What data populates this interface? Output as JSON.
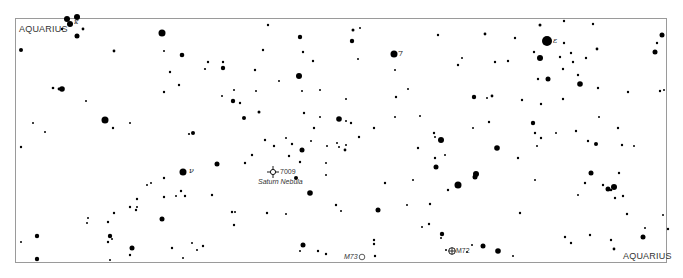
{
  "map": {
    "type": "star-chart",
    "constellation_labels": [
      {
        "text": "AQUARIUS",
        "x": 19,
        "y": 22
      },
      {
        "text": "AQUARIUS",
        "x": 623,
        "y": 250
      }
    ],
    "greek_labels": [
      {
        "text": "ν",
        "x": 190,
        "y": 168,
        "note": "nu"
      },
      {
        "text": "ε",
        "x": 554,
        "y": 38,
        "note": "epsilon"
      },
      {
        "text": "7",
        "x": 398,
        "y": 51
      },
      {
        "text": "κ",
        "x": 74,
        "y": 20
      }
    ],
    "deep_sky_objects": [
      {
        "id": "7009",
        "name": "Saturn Nebula",
        "type": "planetary-nebula",
        "x": 273,
        "y": 172
      },
      {
        "id": "M73",
        "type": "asterism",
        "x": 372,
        "y": 257
      },
      {
        "id": "M72",
        "type": "globular-cluster",
        "x": 452,
        "y": 251
      }
    ],
    "stars": [
      [
        67,
        19,
        3
      ],
      [
        77,
        17,
        3
      ],
      [
        70,
        24,
        3
      ],
      [
        62,
        29,
        1.2
      ],
      [
        83,
        29,
        1.4
      ],
      [
        77,
        36,
        2.5
      ],
      [
        162,
        33,
        3.5
      ],
      [
        21,
        50,
        2
      ],
      [
        114,
        51,
        1.4
      ],
      [
        164,
        51,
        1
      ],
      [
        182,
        55,
        2.3
      ],
      [
        208,
        62,
        1.2
      ],
      [
        205,
        69,
        1.1
      ],
      [
        223,
        62,
        1.2
      ],
      [
        223,
        68,
        2.2
      ],
      [
        170,
        72,
        1.2
      ],
      [
        53,
        88,
        1.3
      ],
      [
        59,
        89,
        1.4
      ],
      [
        62,
        89,
        2.8
      ],
      [
        105,
        120,
        3.5
      ],
      [
        86,
        101,
        1
      ],
      [
        33,
        123,
        1
      ],
      [
        45,
        132,
        1
      ],
      [
        113,
        128,
        1.2
      ],
      [
        130,
        123,
        1
      ],
      [
        189,
        134,
        1.1
      ],
      [
        193,
        133,
        2
      ],
      [
        164,
        92,
        1.2
      ],
      [
        179,
        85,
        1.2
      ],
      [
        234,
        90,
        1
      ],
      [
        222,
        96,
        1
      ],
      [
        233,
        101,
        2.2
      ],
      [
        268,
        25,
        1.2
      ],
      [
        300,
        37,
        2.2
      ],
      [
        263,
        50,
        1.2
      ],
      [
        303,
        52,
        1.2
      ],
      [
        313,
        61,
        1.2
      ],
      [
        299,
        76,
        3
      ],
      [
        255,
        70,
        1.2
      ],
      [
        256,
        91,
        1
      ],
      [
        302,
        91,
        1
      ],
      [
        279,
        81,
        1
      ],
      [
        240,
        103,
        1.2
      ],
      [
        259,
        112,
        1.5
      ],
      [
        244,
        118,
        2
      ],
      [
        320,
        90,
        1
      ],
      [
        320,
        117,
        1
      ],
      [
        353,
        30,
        1.5
      ],
      [
        360,
        28,
        1
      ],
      [
        352,
        41,
        2.2
      ],
      [
        394,
        54,
        3.5
      ],
      [
        395,
        70,
        1
      ],
      [
        438,
        35,
        1.2
      ],
      [
        396,
        97,
        1.2
      ],
      [
        408,
        89,
        1
      ],
      [
        358,
        59,
        1
      ],
      [
        339,
        119,
        2.8
      ],
      [
        351,
        123,
        1.2
      ],
      [
        374,
        128,
        1.2
      ],
      [
        420,
        116,
        1
      ],
      [
        395,
        117,
        1
      ],
      [
        462,
        58,
        1
      ],
      [
        495,
        62,
        1.2
      ],
      [
        485,
        34,
        1.4
      ],
      [
        515,
        38,
        1.2
      ],
      [
        540,
        25,
        1.5
      ],
      [
        564,
        21,
        1.2
      ],
      [
        593,
        24,
        1.2
      ],
      [
        547,
        41,
        5
      ],
      [
        564,
        43,
        1.2
      ],
      [
        534,
        52,
        1.2
      ],
      [
        540,
        58,
        3
      ],
      [
        571,
        53,
        1.2
      ],
      [
        586,
        58,
        1.2
      ],
      [
        560,
        57,
        1.2
      ],
      [
        597,
        49,
        1.4
      ],
      [
        508,
        61,
        1.2
      ],
      [
        573,
        62,
        1.2
      ],
      [
        563,
        69,
        1.2
      ],
      [
        538,
        79,
        1.2
      ],
      [
        548,
        79,
        2.5
      ],
      [
        578,
        75,
        1.2
      ],
      [
        580,
        84,
        2.8
      ],
      [
        458,
        65,
        1.2
      ],
      [
        474,
        97,
        2.2
      ],
      [
        487,
        98,
        1
      ],
      [
        522,
        100,
        1.2
      ],
      [
        541,
        104,
        1.2
      ],
      [
        563,
        99,
        1.2
      ],
      [
        598,
        88,
        1.2
      ],
      [
        628,
        92,
        1.2
      ],
      [
        662,
        35,
        2.5
      ],
      [
        657,
        43,
        1.2
      ],
      [
        655,
        52,
        2.5
      ],
      [
        660,
        91,
        1.2
      ],
      [
        664,
        90,
        1
      ],
      [
        434,
        133,
        1.2
      ],
      [
        441,
        140,
        3
      ],
      [
        435,
        137,
        1
      ],
      [
        473,
        128,
        1
      ],
      [
        489,
        122,
        1.2
      ],
      [
        533,
        123,
        2.2
      ],
      [
        492,
        96,
        1.4
      ],
      [
        418,
        148,
        1.2
      ],
      [
        435,
        158,
        1.2
      ],
      [
        413,
        180,
        1
      ],
      [
        436,
        167,
        2.5
      ],
      [
        445,
        155,
        1
      ],
      [
        475,
        177,
        2.5
      ],
      [
        458,
        185,
        3.5
      ],
      [
        448,
        190,
        1.2
      ],
      [
        407,
        205,
        1
      ],
      [
        385,
        183,
        1.2
      ],
      [
        378,
        210,
        2.5
      ],
      [
        422,
        227,
        1
      ],
      [
        442,
        234,
        2.2
      ],
      [
        430,
        204,
        1.2
      ],
      [
        429,
        224,
        1.2
      ],
      [
        497,
        148,
        2.8
      ],
      [
        476,
        174,
        3
      ],
      [
        518,
        158,
        1.2
      ],
      [
        535,
        133,
        1.2
      ],
      [
        535,
        180,
        1
      ],
      [
        541,
        138,
        1.2
      ],
      [
        537,
        146,
        1
      ],
      [
        556,
        133,
        1
      ],
      [
        576,
        131,
        1.2
      ],
      [
        588,
        141,
        1.2
      ],
      [
        596,
        144,
        2
      ],
      [
        622,
        145,
        1.2
      ],
      [
        634,
        146,
        1
      ],
      [
        618,
        128,
        1.2
      ],
      [
        608,
        189,
        2.5
      ],
      [
        603,
        185,
        1.2
      ],
      [
        611,
        190,
        1.3
      ],
      [
        614,
        187,
        3
      ],
      [
        615,
        198,
        1.2
      ],
      [
        623,
        196,
        1.2
      ],
      [
        627,
        214,
        1.2
      ],
      [
        645,
        228,
        1
      ],
      [
        643,
        237,
        2.5
      ],
      [
        565,
        237,
        1.2
      ],
      [
        571,
        243,
        1.2
      ],
      [
        590,
        235,
        1.2
      ],
      [
        614,
        249,
        1.4
      ],
      [
        668,
        229,
        1.2
      ],
      [
        663,
        215,
        1
      ],
      [
        483,
        246,
        2.5
      ],
      [
        498,
        251,
        2.8
      ],
      [
        513,
        256,
        1
      ],
      [
        446,
        250,
        1
      ],
      [
        472,
        245,
        1
      ],
      [
        520,
        213,
        1.2
      ],
      [
        611,
        240,
        1.2
      ],
      [
        599,
        117,
        1
      ],
      [
        619,
        173,
        1.2
      ],
      [
        585,
        183,
        1.2
      ],
      [
        591,
        173,
        2.5
      ],
      [
        578,
        195,
        1
      ],
      [
        21,
        147,
        1.2
      ],
      [
        37,
        236,
        2.2
      ],
      [
        37,
        259,
        2.2
      ],
      [
        21,
        242,
        1
      ],
      [
        110,
        236,
        2.2
      ],
      [
        112,
        239,
        1
      ],
      [
        130,
        255,
        1.2
      ],
      [
        110,
        260,
        1
      ],
      [
        132,
        248,
        2.5
      ],
      [
        183,
        172,
        3.5
      ],
      [
        217,
        164,
        2.5
      ],
      [
        212,
        195,
        1.2
      ],
      [
        203,
        246,
        1.2
      ],
      [
        192,
        243,
        1
      ],
      [
        172,
        248,
        1.2
      ],
      [
        183,
        258,
        1
      ],
      [
        197,
        250,
        1
      ],
      [
        164,
        178,
        1.2
      ],
      [
        147,
        185,
        1
      ],
      [
        151,
        183,
        1
      ],
      [
        137,
        199,
        1.2
      ],
      [
        137,
        207,
        1
      ],
      [
        136,
        210,
        1.2
      ],
      [
        114,
        213,
        1.2
      ],
      [
        108,
        222,
        1.2
      ],
      [
        108,
        242,
        1.2
      ],
      [
        88,
        218,
        1
      ],
      [
        87,
        223,
        1
      ],
      [
        164,
        197,
        1.2
      ],
      [
        176,
        196,
        1
      ],
      [
        181,
        191,
        1.2
      ],
      [
        185,
        196,
        1.2
      ],
      [
        162,
        219,
        2.5
      ],
      [
        130,
        207,
        1.2
      ],
      [
        252,
        155,
        1.2
      ],
      [
        245,
        163,
        1.2
      ],
      [
        274,
        146,
        1.2
      ],
      [
        292,
        144,
        1.2
      ],
      [
        289,
        156,
        1.2
      ],
      [
        300,
        162,
        1.2
      ],
      [
        302,
        150,
        2.5
      ],
      [
        326,
        163,
        1
      ],
      [
        327,
        146,
        1
      ],
      [
        296,
        178,
        2
      ],
      [
        326,
        175,
        1
      ],
      [
        310,
        193,
        2.8
      ],
      [
        286,
        138,
        1
      ],
      [
        265,
        140,
        1.2
      ],
      [
        311,
        141,
        1
      ],
      [
        337,
        143,
        1
      ],
      [
        339,
        147,
        1
      ],
      [
        345,
        150,
        1.4
      ],
      [
        346,
        145,
        1
      ],
      [
        359,
        137,
        1.2
      ],
      [
        346,
        121,
        1
      ],
      [
        346,
        99,
        1
      ],
      [
        304,
        113,
        1.2
      ],
      [
        314,
        128,
        1.2
      ],
      [
        286,
        214,
        1
      ],
      [
        232,
        212,
        1.2
      ],
      [
        235,
        212,
        1
      ],
      [
        267,
        213,
        1.2
      ],
      [
        234,
        225,
        1.2
      ],
      [
        336,
        205,
        1.2
      ],
      [
        341,
        211,
        1
      ],
      [
        303,
        245,
        2.5
      ],
      [
        300,
        251,
        1
      ],
      [
        318,
        251,
        1.2
      ],
      [
        326,
        254,
        1.2
      ],
      [
        374,
        240,
        1.2
      ],
      [
        374,
        244,
        1.2
      ],
      [
        375,
        256,
        1.2
      ],
      [
        441,
        238,
        1
      ],
      [
        467,
        252,
        1
      ]
    ],
    "colors": {
      "background": "#ffffff",
      "star": "#000000",
      "frame": "#9a9a9a",
      "label": "#333333"
    }
  }
}
